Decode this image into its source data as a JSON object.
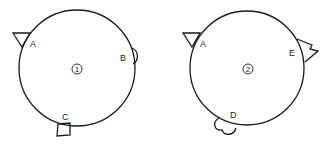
{
  "diagram": {
    "figures": [
      {
        "id": "1",
        "number_label": "1",
        "attachments": [
          {
            "label": "A",
            "shape": "triangle"
          },
          {
            "label": "B",
            "shape": "semicircle"
          },
          {
            "label": "C",
            "shape": "square"
          }
        ]
      },
      {
        "id": "2",
        "number_label": "2",
        "attachments": [
          {
            "label": "A",
            "shape": "triangle"
          },
          {
            "label": "E",
            "shape": "zigzag-flag"
          },
          {
            "label": "D",
            "shape": "double-lobe"
          }
        ]
      }
    ],
    "colors": {
      "stroke": "#1a1a1a",
      "background": "#ffffff"
    }
  }
}
